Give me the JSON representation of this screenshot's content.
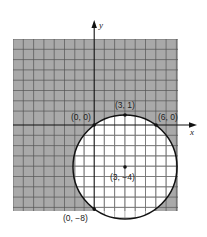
{
  "diagram": {
    "type": "coordinate-plane-circle",
    "axes": {
      "x_label": "x",
      "y_label": "y"
    },
    "circle": {
      "center": [
        3,
        -4
      ],
      "radius": 5
    },
    "points": [
      {
        "coord": [
          3,
          1
        ],
        "label": "(3, 1)"
      },
      {
        "coord": [
          0,
          0
        ],
        "label": "(0, 0)"
      },
      {
        "coord": [
          6,
          0
        ],
        "label": "(6, 0)"
      },
      {
        "coord": [
          3,
          -4
        ],
        "label": "(3, −4)"
      },
      {
        "coord": [
          0,
          -8
        ],
        "label": "(0, −8)"
      }
    ],
    "grid": {
      "x_range": [
        -8,
        8
      ],
      "y_range": [
        -8,
        8
      ],
      "shaded_outside_circle": true
    },
    "colors": {
      "shade": "#a9a9a9",
      "grid_line": "#555555",
      "inner_grid_line": "#777777",
      "curve": "#111111"
    }
  }
}
